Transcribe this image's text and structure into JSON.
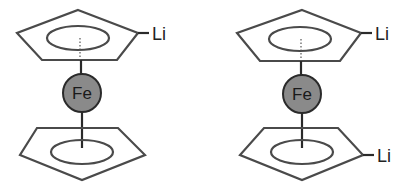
{
  "diagram": {
    "molecules": [
      {
        "name": "monolithioferrocene",
        "metal_label": "Fe",
        "top_ring_substituent": "Li",
        "bottom_ring_substituent": null
      },
      {
        "name": "1,1'-dilithioferrocene",
        "metal_label": "Fe",
        "top_ring_substituent": "Li",
        "bottom_ring_substituent": "Li"
      }
    ],
    "colors": {
      "ring_stroke": "#4a4a4a",
      "iron_fill": "#8a8a8a",
      "background": "#ffffff"
    }
  }
}
